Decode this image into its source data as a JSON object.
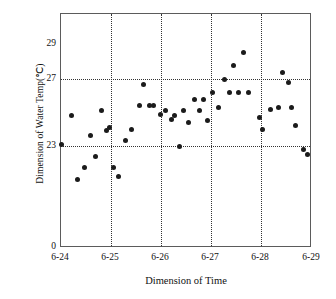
{
  "chart_data": {
    "type": "scatter",
    "title": "",
    "xlabel": "Dimension of Time",
    "ylabel": "Dimension of Water Temp(℃)",
    "xtick_labels": [
      "6-24",
      "6-25",
      "6-26",
      "6-27",
      "6-28",
      "6-29"
    ],
    "ytick_labels": [
      "29",
      "27",
      "23",
      "0"
    ],
    "ytick_values": [
      29,
      27,
      23,
      0
    ],
    "ylim": [
      0,
      30
    ],
    "xlim": [
      "6-24",
      "6-29"
    ],
    "grid": "dotted horizontal gridlines at 27 and 23; dotted vertical gridlines at 6-25, 6-26, 6-27, 6-28",
    "marker": "filled-circle",
    "marker_color": "#1b1b1b",
    "series": [
      {
        "name": "Water Temp",
        "points": [
          {
            "x": "6-24 00:00",
            "day": 0.0,
            "y": 23.1
          },
          {
            "x": "6-24 05:00",
            "day": 0.21,
            "y": 24.8
          },
          {
            "x": "6-24 08:00",
            "day": 0.33,
            "y": 21.0
          },
          {
            "x": "6-24 12:00",
            "day": 0.48,
            "y": 21.7
          },
          {
            "x": "6-24 16:00",
            "day": 0.6,
            "y": 23.6
          },
          {
            "x": "6-24 20:00",
            "day": 0.7,
            "y": 22.4
          },
          {
            "x": "6-24 24:00",
            "day": 0.82,
            "y": 25.1
          },
          {
            "x": "6-25 02:00",
            "day": 0.92,
            "y": 23.9
          },
          {
            "x": "6-25 05:00",
            "day": 0.98,
            "y": 24.1
          },
          {
            "x": "6-25 08:00",
            "day": 1.06,
            "y": 21.7
          },
          {
            "x": "6-25 12:00",
            "day": 1.16,
            "y": 21.2
          },
          {
            "x": "6-25 17:00",
            "day": 1.3,
            "y": 23.3
          },
          {
            "x": "6-25 21:00",
            "day": 1.42,
            "y": 24.0
          },
          {
            "x": "6-26 00:00",
            "day": 1.58,
            "y": 25.4
          },
          {
            "x": "6-26 03:00",
            "day": 1.66,
            "y": 26.7
          },
          {
            "x": "6-26 07:00",
            "day": 1.78,
            "y": 25.4
          },
          {
            "x": "6-26 10:00",
            "day": 1.86,
            "y": 25.4
          },
          {
            "x": "6-26 14:00",
            "day": 2.0,
            "y": 24.9
          },
          {
            "x": "6-26 18:00",
            "day": 2.1,
            "y": 25.1
          },
          {
            "x": "6-26 22:00",
            "day": 2.22,
            "y": 24.6
          },
          {
            "x": "6-27 01:00",
            "day": 2.27,
            "y": 24.8
          },
          {
            "x": "6-27 04:00",
            "day": 2.37,
            "y": 23.0
          },
          {
            "x": "6-27 08:00",
            "day": 2.46,
            "y": 25.1
          },
          {
            "x": "6-27 12:00",
            "day": 2.56,
            "y": 24.4
          },
          {
            "x": "6-27 16:00",
            "day": 2.68,
            "y": 25.8
          },
          {
            "x": "6-27 20:00",
            "day": 2.78,
            "y": 25.1
          },
          {
            "x": "6-27 23:00",
            "day": 2.86,
            "y": 25.8
          },
          {
            "x": "6-28 02:00",
            "day": 2.95,
            "y": 24.5
          },
          {
            "x": "6-28 05:00",
            "day": 3.05,
            "y": 26.2
          },
          {
            "x": "6-28 09:00",
            "day": 3.16,
            "y": 25.3
          },
          {
            "x": "6-28 13:00",
            "day": 3.28,
            "y": 27.0
          },
          {
            "x": "6-28 17:00",
            "day": 3.38,
            "y": 26.2
          },
          {
            "x": "6-28 20:00",
            "day": 3.47,
            "y": 27.8
          },
          {
            "x": "6-28 23:00",
            "day": 3.56,
            "y": 26.2
          },
          {
            "x": "6-29 02:00",
            "day": 3.66,
            "y": 28.6
          },
          {
            "x": "6-29 05:00",
            "day": 3.76,
            "y": 26.2
          },
          {
            "x": "6-29 08:00",
            "day": 3.98,
            "y": 24.7
          },
          {
            "x": "6-29 11:00",
            "day": 4.05,
            "y": 24.0
          },
          {
            "x": "6-29 14:00",
            "day": 4.2,
            "y": 25.2
          },
          {
            "x": "6-29 17:00",
            "day": 4.37,
            "y": 25.3
          },
          {
            "x": "6-29 20:00",
            "day": 4.45,
            "y": 27.4
          },
          {
            "x": "6-29 22:00",
            "day": 4.56,
            "y": 26.8
          },
          {
            "x": "6-29 23:00",
            "day": 4.62,
            "y": 25.3
          },
          {
            "x": "6-29 23:30",
            "day": 4.7,
            "y": 24.2
          },
          {
            "x": "6-29 23:45",
            "day": 4.86,
            "y": 22.8
          },
          {
            "x": "6-29 24:00",
            "day": 4.95,
            "y": 22.5
          }
        ]
      }
    ]
  },
  "axes": {
    "gridlines_y": [
      27,
      23
    ],
    "gridlines_x": [
      "6-25",
      "6-26",
      "6-27",
      "6-28"
    ]
  }
}
